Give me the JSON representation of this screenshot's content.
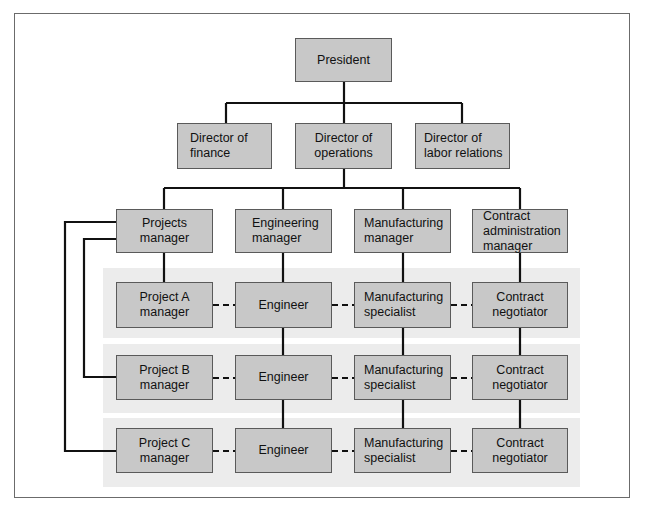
{
  "chart_title": "",
  "colors": {
    "box_fill": "#c8c8c8",
    "box_border": "#5a5a5a",
    "band_fill": "#ececec",
    "line": "#111111",
    "frame": "#6b6b6b"
  },
  "top": {
    "president": "President"
  },
  "directors": [
    {
      "id": "finance",
      "label": "Director of\nfinance"
    },
    {
      "id": "operations",
      "label": "Director of\noperations"
    },
    {
      "id": "labor",
      "label": "Director of\nlabor relations"
    }
  ],
  "managers": [
    {
      "id": "projects",
      "label": "Projects\nmanager"
    },
    {
      "id": "engineering",
      "label": "Engineering\nmanager"
    },
    {
      "id": "manufacturing",
      "label": "Manufacturing\nmanager"
    },
    {
      "id": "contract",
      "label": "Contract\nadministration\nmanager"
    }
  ],
  "project_rows": [
    {
      "project_manager": "Project A\nmanager",
      "engineer": "Engineer",
      "specialist": "Manufacturing\nspecialist",
      "negotiator": "Contract\nnegotiator"
    },
    {
      "project_manager": "Project B\nmanager",
      "engineer": "Engineer",
      "specialist": "Manufacturing\nspecialist",
      "negotiator": "Contract\nnegotiator"
    },
    {
      "project_manager": "Project C\nmanager",
      "engineer": "Engineer",
      "specialist": "Manufacturing\nspecialist",
      "negotiator": "Contract\nnegotiator"
    }
  ],
  "legend": {
    "solid_line": "line authority",
    "dashed_line": "project coordination"
  }
}
